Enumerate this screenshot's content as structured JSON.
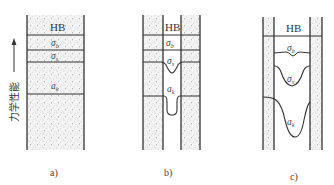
{
  "axis_label": "力学性能",
  "axis_arrow": "up-arrow",
  "panels": [
    {
      "caption": "a)",
      "bands": [
        {
          "label": "HB"
        },
        {
          "sym": "σ",
          "sub": "b"
        },
        {
          "sym": "σ",
          "sub": "s"
        },
        {
          "sym": "a",
          "sub": "k"
        }
      ]
    },
    {
      "caption": "b)",
      "bands": [
        {
          "label": "HB"
        },
        {
          "sym": "σ",
          "sub": "b"
        },
        {
          "sym": "σ",
          "sub": "s"
        },
        {
          "sym": "a",
          "sub": "k"
        }
      ]
    },
    {
      "caption": "c)",
      "bands": [
        {
          "label": "HB"
        },
        {
          "sym": "σ",
          "sub": "b"
        },
        {
          "sym": "σ",
          "sub": "s"
        },
        {
          "sym": "a",
          "sub": "k"
        }
      ]
    }
  ],
  "colors": {
    "line": "#333333",
    "stipple": "#9a9a9a",
    "background": "#ffffff"
  }
}
